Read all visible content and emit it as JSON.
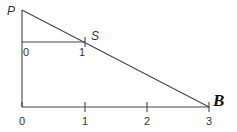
{
  "diagram": {
    "points": {
      "P": {
        "label": "P"
      },
      "S": {
        "label": "S"
      },
      "B": {
        "label": "B"
      }
    },
    "bottom_axis": {
      "ticks": [
        "0",
        "1",
        "2",
        "3"
      ]
    },
    "upper_segment": {
      "ticks": [
        "0",
        "1"
      ]
    }
  }
}
